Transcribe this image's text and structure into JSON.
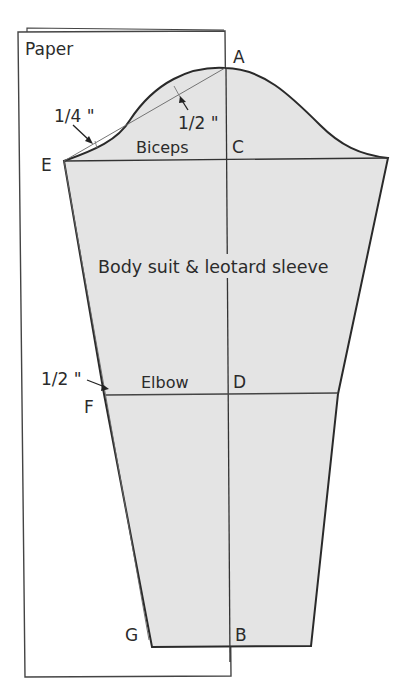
{
  "diagram": {
    "title": "Body suit & leotard sleeve",
    "paper_label": "Paper",
    "points": {
      "A": "A",
      "B": "B",
      "C": "C",
      "D": "D",
      "E": "E",
      "F": "F",
      "G": "G"
    },
    "lines": {
      "biceps": "Biceps",
      "elbow": "Elbow"
    },
    "measurements": {
      "cap_upper": "1/2 \"",
      "cap_lower": "1/4 \"",
      "elbow_offset": "1/2 \""
    },
    "colors": {
      "fill": "#e4e4e4",
      "outline": "#2a2a2a",
      "guide": "#555555"
    }
  }
}
